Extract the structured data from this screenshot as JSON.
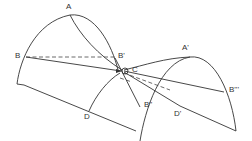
{
  "diagram": {
    "type": "geometric-construction",
    "stroke_color": "#333333",
    "background": "#ffffff",
    "labels": {
      "A": "A",
      "A_prime": "A'",
      "B": "B",
      "B_prime": "B'",
      "B_double_prime": "B''",
      "B_triple_prime": "B'''",
      "C": "C",
      "D": "D",
      "D_prime": "D'"
    },
    "elements": [
      {
        "name": "arc-left",
        "description": "large arch from lower-left through A down to near C"
      },
      {
        "name": "arc-right",
        "description": "arch from D through A' down to lower-right corner"
      },
      {
        "name": "line-A-to-C",
        "description": "curve from A to C"
      },
      {
        "name": "dashed-B-B-prime",
        "description": "horizontal dashed line from B to B'"
      },
      {
        "name": "line-B-to-C",
        "description": "line from B to C"
      },
      {
        "name": "line-C-to-B-triple-prime",
        "description": "line from C to B'''"
      },
      {
        "name": "line-bottom-left",
        "description": "line from lower-left corner down-right through D"
      },
      {
        "name": "line-C-to-D-prime",
        "description": "line from C through D' to lower-right corner"
      },
      {
        "name": "dashed-C-to-D-prime",
        "description": "dashed line from C toward D'"
      },
      {
        "name": "line-through-B-double-prime",
        "description": "line from B' through C to B'' downward"
      },
      {
        "name": "small-circle-C",
        "description": "small circle marking point C"
      }
    ]
  }
}
